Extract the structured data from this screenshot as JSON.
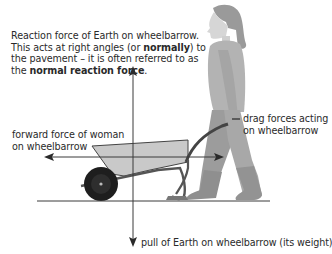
{
  "diagram": {
    "labels": {
      "reaction": {
        "line1": "Reaction force of Earth on wheelbarrow.",
        "line2_pre": "This acts at right angles (or ",
        "line2_bold": "normally",
        "line2_post": ") to",
        "line3": "the pavement – it is often referred to as",
        "line4_pre": "the ",
        "line4_bold": "normal reaction force",
        "line4_post": "."
      },
      "forward": {
        "line1": "forward force of woman",
        "line2": "on wheelbarrow"
      },
      "drag": {
        "line1": "drag forces acting",
        "line2": "on wheelbarrow"
      },
      "weight": {
        "text": "pull of Earth on wheelbarrow (its weight)"
      }
    },
    "arrows": [
      {
        "name": "normal-reaction",
        "direction": "up"
      },
      {
        "name": "weight",
        "direction": "down"
      },
      {
        "name": "forward-force",
        "direction": "left"
      },
      {
        "name": "drag-force",
        "direction": "right"
      }
    ],
    "colors": {
      "line": "#3a3a3a",
      "barrow_tray": "#c9c9c9",
      "wheel": "#1e1e1e",
      "figure": "#a9a9a9"
    }
  }
}
